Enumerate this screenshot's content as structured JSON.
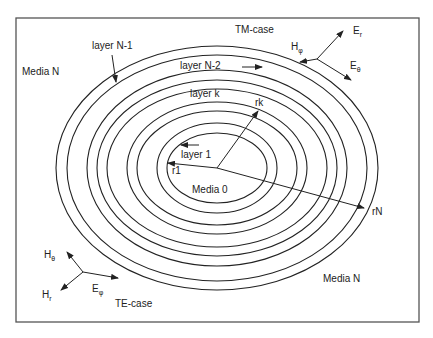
{
  "figure": {
    "frame": {
      "x": 16,
      "y": 18,
      "width": 403,
      "height": 304,
      "stroke": "#555555"
    },
    "stroke_color": "#222222",
    "ellipses": {
      "center": {
        "x": 217,
        "y": 168
      },
      "rings": [
        {
          "rx": 161,
          "ry": 122
        },
        {
          "rx": 150,
          "ry": 113
        },
        {
          "rx": 130,
          "ry": 98
        },
        {
          "rx": 120,
          "ry": 88
        },
        {
          "rx": 110,
          "ry": 79
        },
        {
          "rx": 90,
          "ry": 66
        },
        {
          "rx": 80,
          "ry": 57
        },
        {
          "rx": 60,
          "ry": 45
        },
        {
          "rx": 50,
          "ry": 35
        }
      ]
    }
  },
  "labels": {
    "tm_case": "TM-case",
    "te_case": "TE-case",
    "media_n_top": "Media N",
    "media_n_bottom": "Media N",
    "media_0": "Media 0",
    "layer_n1": "layer N-1",
    "layer_n2": "layer N-2",
    "layer_k": "layer k",
    "layer_1": "layer 1",
    "r1": "r1",
    "rk": "rk",
    "rN": "rN"
  },
  "tm_vectors": {
    "er": {
      "main": "E",
      "sub": "r"
    },
    "htheta_phi": {
      "main": "H",
      "sub": "φ"
    },
    "etheta": {
      "main": "E",
      "sub": "θ"
    }
  },
  "te_vectors": {
    "htheta": {
      "main": "H",
      "sub": "θ"
    },
    "hr": {
      "main": "H",
      "sub": "r"
    },
    "ephi": {
      "main": "E",
      "sub": "φ"
    }
  }
}
